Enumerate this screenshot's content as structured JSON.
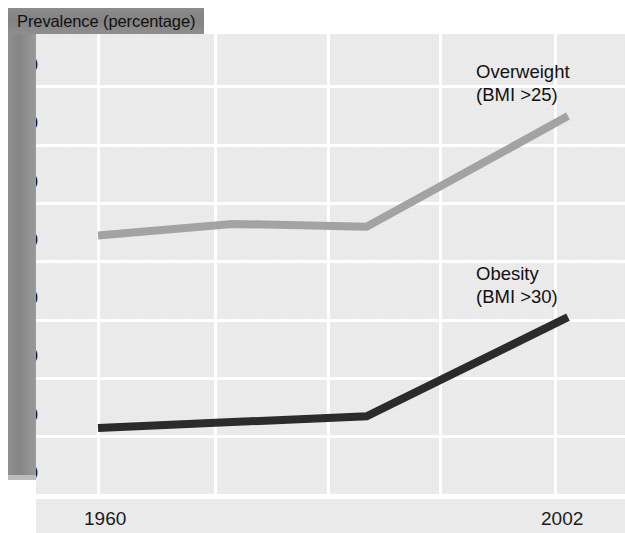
{
  "chart_data": {
    "type": "line",
    "title": "Prevalence (percentage)",
    "xlabel": "",
    "ylabel": "Prevalence (percentage)",
    "xlim": [
      1960,
      2002
    ],
    "ylim": [
      0,
      75
    ],
    "grid": true,
    "legend_position": "inline-right",
    "y_ticks": [
      0,
      10,
      20,
      30,
      40,
      50,
      60,
      70
    ],
    "y_tick_labels": [
      "0",
      "10",
      "20",
      "30",
      "40",
      "50",
      "60",
      "70"
    ],
    "x_ticks": [
      1960,
      2002
    ],
    "x_tick_labels": [
      "1960",
      "2002"
    ],
    "x": [
      1960,
      1972,
      1984,
      2002
    ],
    "series": [
      {
        "name": "Overweight (BMI >25)",
        "label_line1": "Overweight",
        "label_line2": "(BMI >25)",
        "color": "#a3a3a3",
        "values": [
          44.5,
          46.5,
          46.0,
          65.0
        ]
      },
      {
        "name": "Obesity (BMI >30)",
        "label_line1": "Obesity",
        "label_line2": "(BMI >30)",
        "color": "#2b2b2b",
        "values": [
          11.5,
          12.5,
          13.5,
          30.5
        ]
      }
    ]
  },
  "figure": {
    "title_band_label": "Prevalence (percentage)",
    "plot_background": "#e9e9e9",
    "grid_color": "#ffffff",
    "spine_color": "#8a8a8a",
    "text_color": "#1a1a1a"
  },
  "y_axis": {
    "labels": [
      "70",
      "60",
      "50",
      "40",
      "30",
      "20",
      "10",
      "0"
    ]
  },
  "x_axis": {
    "start_label": "1960",
    "end_label": "2002"
  },
  "annotations": {
    "overweight": {
      "line1": "Overweight",
      "line2": "(BMI >25)"
    },
    "obesity": {
      "line1": "Obesity",
      "line2": "(BMI >30)"
    }
  }
}
